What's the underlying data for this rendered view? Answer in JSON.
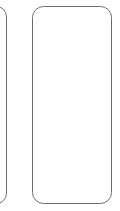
{
  "canvas": {
    "width": 120,
    "height": 211,
    "background_color": "#ffffff",
    "description": "Two rounded rectangle outlines on a plain white background"
  },
  "style": {
    "stroke_color": "#6e6e6e",
    "stroke_width_px": 1,
    "fill_color": "#ffffff",
    "corner_radius_px": 11
  },
  "shapes": [
    {
      "id": "frame-left-partial",
      "label": "",
      "type": "rounded-rectangle",
      "clipped": "left",
      "x": -38,
      "y": 5.5,
      "width": 45,
      "height": 199,
      "radius": 11,
      "visible_right_edge_x": 7,
      "top_y": 5.5,
      "bottom_y": 204.5
    },
    {
      "id": "frame-right-full",
      "label": "",
      "type": "rounded-rectangle",
      "clipped": "none",
      "x": 32,
      "y": 6,
      "width": 80,
      "height": 198,
      "radius": 11,
      "left_edge_x": 32,
      "right_edge_x": 112,
      "top_y": 6,
      "bottom_y": 204
    }
  ]
}
